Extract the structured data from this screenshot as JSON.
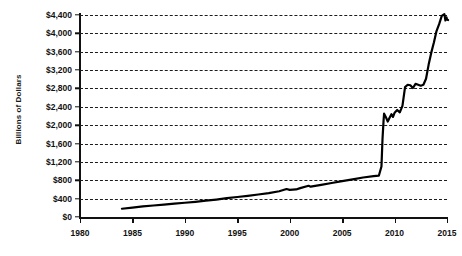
{
  "chart_data": {
    "type": "line",
    "title": "",
    "xlabel": "",
    "ylabel": "Billions of Dollars",
    "xlim": [
      1980,
      2015
    ],
    "ylim": [
      0,
      4400
    ],
    "grid": true,
    "legend": "none",
    "line_color": "#000000",
    "axis_color": "#111111",
    "gridline_color": "#1c1c1c",
    "background_color": "#ffffff",
    "x_ticks": [
      1980,
      1985,
      1990,
      1995,
      2000,
      2005,
      2010,
      2015
    ],
    "x_tick_labels": [
      "1980",
      "1985",
      "1990",
      "1995",
      "2000",
      "2005",
      "2010",
      "2015"
    ],
    "y_ticks": [
      0,
      400,
      800,
      1200,
      1600,
      2000,
      2400,
      2800,
      3200,
      3600,
      4000,
      4400
    ],
    "y_tick_labels": [
      "$0",
      "$400",
      "$800",
      "$1,200",
      "$1,600",
      "$2,000",
      "$2,400",
      "$2,800",
      "$3,200",
      "$3,600",
      "$4,000",
      "$4,400"
    ],
    "series": [
      {
        "name": "Total Assets",
        "x": [
          1984.0,
          1985.0,
          1986.0,
          1987.0,
          1988.0,
          1989.0,
          1990.0,
          1991.0,
          1992.0,
          1993.0,
          1994.0,
          1995.0,
          1996.0,
          1997.0,
          1998.0,
          1999.0,
          1999.7,
          2000.0,
          2000.6,
          2001.0,
          2001.8,
          2002.0,
          2003.0,
          2004.0,
          2005.0,
          2006.0,
          2007.0,
          2008.0,
          2008.5,
          2008.75,
          2008.85,
          2008.95,
          2009.0,
          2009.2,
          2009.35,
          2009.5,
          2009.7,
          2009.85,
          2010.0,
          2010.25,
          2010.5,
          2010.75,
          2011.0,
          2011.25,
          2011.5,
          2011.75,
          2012.0,
          2012.25,
          2012.5,
          2012.75,
          2013.0,
          2013.25,
          2013.5,
          2013.75,
          2014.0,
          2014.25,
          2014.5,
          2014.75,
          2014.85,
          2014.95,
          2015.0,
          2015.1
        ],
        "y": [
          180,
          205,
          230,
          250,
          270,
          290,
          310,
          330,
          355,
          380,
          410,
          435,
          460,
          490,
          520,
          560,
          610,
          590,
          600,
          630,
          680,
          660,
          700,
          740,
          780,
          820,
          860,
          890,
          900,
          1100,
          1700,
          2100,
          2250,
          2160,
          2080,
          2150,
          2240,
          2180,
          2270,
          2330,
          2280,
          2420,
          2830,
          2880,
          2870,
          2810,
          2900,
          2880,
          2860,
          2880,
          3010,
          3320,
          3580,
          3800,
          4050,
          4200,
          4380,
          4420,
          4280,
          4350,
          4300,
          4290
        ]
      }
    ]
  }
}
